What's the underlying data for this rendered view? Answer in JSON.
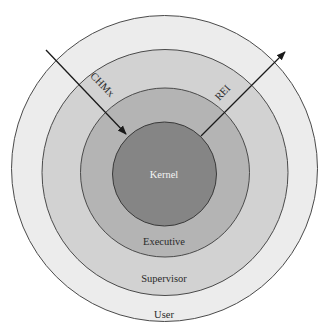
{
  "diagram": {
    "type": "concentric-rings",
    "rings": [
      {
        "name": "user",
        "label": "User",
        "color": "#ececec"
      },
      {
        "name": "supervisor",
        "label": "Supervisor",
        "color": "#d2d2d2"
      },
      {
        "name": "executive",
        "label": "Executive",
        "color": "#b4b4b4"
      },
      {
        "name": "kernel",
        "label": "Kernel",
        "color": "#858585"
      }
    ],
    "arrows": [
      {
        "name": "chmx",
        "label": "CHMx",
        "direction": "inward"
      },
      {
        "name": "rei",
        "label": "REI",
        "direction": "outward"
      }
    ],
    "stroke_color": "#3a3a3a"
  }
}
